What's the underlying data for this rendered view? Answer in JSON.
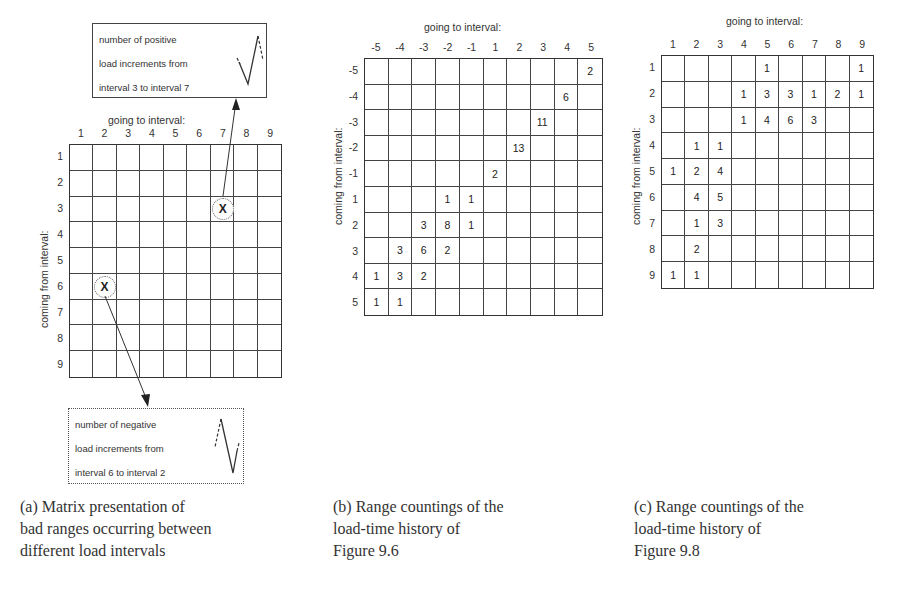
{
  "panel_a": {
    "callout_top": {
      "lines": [
        "number of positive",
        "load increments from",
        "interval 3 to interval 7"
      ]
    },
    "callout_bottom": {
      "lines": [
        "number of negative",
        "load increments from",
        "interval 6 to interval 2"
      ]
    },
    "column_axis_title": "going to interval:",
    "row_axis_title": "coming from interval:",
    "columns": [
      "1",
      "2",
      "3",
      "4",
      "5",
      "6",
      "7",
      "8",
      "9"
    ],
    "rows": [
      "1",
      "2",
      "3",
      "4",
      "5",
      "6",
      "7",
      "8",
      "9"
    ],
    "markers": [
      {
        "symbol": "X",
        "row": 3,
        "col": 7
      },
      {
        "symbol": "X",
        "row": 6,
        "col": 2
      }
    ],
    "caption": [
      "(a) Matrix presentation of",
      "bad ranges occurring between",
      "different load intervals"
    ]
  },
  "panel_b": {
    "column_axis_title": "going to interval:",
    "row_axis_title": "coming from interval:",
    "columns": [
      "-5",
      "-4",
      "-3",
      "-2",
      "-1",
      "1",
      "2",
      "3",
      "4",
      "5"
    ],
    "rows": [
      "-5",
      "-4",
      "-3",
      "-2",
      "-1",
      "1",
      "2",
      "3",
      "4",
      "5"
    ],
    "cells": [
      [
        "",
        "",
        "",
        "",
        "",
        "",
        "",
        "",
        "",
        "2"
      ],
      [
        "",
        "",
        "",
        "",
        "",
        "",
        "",
        "",
        "6",
        ""
      ],
      [
        "",
        "",
        "",
        "",
        "",
        "",
        "",
        "11",
        "",
        ""
      ],
      [
        "",
        "",
        "",
        "",
        "",
        "",
        "13",
        "",
        "",
        ""
      ],
      [
        "",
        "",
        "",
        "",
        "",
        "2",
        "",
        "",
        "",
        ""
      ],
      [
        "",
        "",
        "",
        "1",
        "1",
        "",
        "",
        "",
        "",
        ""
      ],
      [
        "",
        "",
        "3",
        "8",
        "1",
        "",
        "",
        "",
        "",
        ""
      ],
      [
        "",
        "3",
        "6",
        "2",
        "",
        "",
        "",
        "",
        "",
        ""
      ],
      [
        "1",
        "3",
        "2",
        "",
        "",
        "",
        "",
        "",
        "",
        ""
      ],
      [
        "1",
        "1",
        "",
        "",
        "",
        "",
        "",
        "",
        "",
        ""
      ]
    ],
    "caption": [
      "(b) Range countings of the",
      "load-time history of",
      "Figure 9.6"
    ]
  },
  "panel_c": {
    "column_axis_title": "going to interval:",
    "row_axis_title": "coming from interval:",
    "columns": [
      "1",
      "2",
      "3",
      "4",
      "5",
      "6",
      "7",
      "8",
      "9"
    ],
    "rows": [
      "1",
      "2",
      "3",
      "4",
      "5",
      "6",
      "7",
      "8",
      "9"
    ],
    "cells": [
      [
        "",
        "",
        "",
        "",
        "1",
        "",
        "",
        "",
        "1"
      ],
      [
        "",
        "",
        "",
        "1",
        "3",
        "3",
        "1",
        "2",
        "1"
      ],
      [
        "",
        "",
        "",
        "1",
        "4",
        "6",
        "3",
        "",
        ""
      ],
      [
        "",
        "1",
        "1",
        "",
        "",
        "",
        "",
        "",
        ""
      ],
      [
        "1",
        "2",
        "4",
        "",
        "",
        "",
        "",
        "",
        ""
      ],
      [
        "",
        "4",
        "5",
        "",
        "",
        "",
        "",
        "",
        ""
      ],
      [
        "",
        "1",
        "3",
        "",
        "",
        "",
        "",
        "",
        ""
      ],
      [
        "",
        "2",
        "",
        "",
        "",
        "",
        "",
        "",
        ""
      ],
      [
        "1",
        "1",
        "",
        "",
        "",
        "",
        "",
        "",
        ""
      ]
    ],
    "caption": [
      "(c) Range countings of the",
      "load-time history of",
      "Figure 9.8"
    ]
  }
}
